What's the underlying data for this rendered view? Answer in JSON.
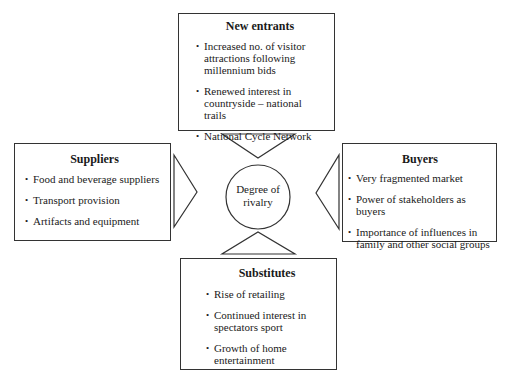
{
  "diagram": {
    "center": {
      "label_line1": "Degree of",
      "label_line2": "rivalry"
    },
    "new_entrants": {
      "title": "New entrants",
      "items": [
        "Increased no. of visitor attractions following millennium bids",
        "Renewed interest in countryside – national trails",
        "National Cycle Network"
      ]
    },
    "suppliers": {
      "title": "Suppliers",
      "items": [
        "Food and beverage suppliers",
        "Transport provision",
        "Artifacts and equipment"
      ]
    },
    "buyers": {
      "title": "Buyers",
      "items": [
        "Very fragmented market",
        "Power of stakeholders as buyers",
        "Importance of influences in family and other social groups"
      ]
    },
    "substitutes": {
      "title": "Substitutes",
      "items": [
        "Rise of retailing",
        "Continued interest in spectators sport",
        "Growth of home entertainment"
      ]
    },
    "colors": {
      "line": "#333333",
      "text": "#1a1a1a",
      "background": "#ffffff"
    }
  }
}
